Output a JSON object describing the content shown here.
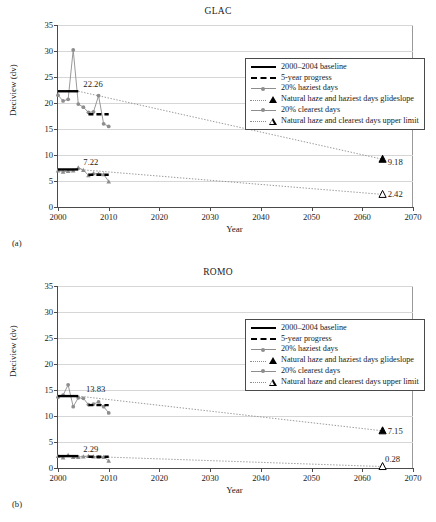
{
  "figure": {
    "axis_label_y": "Deciview (dv)",
    "axis_label_x": "Year",
    "legend": [
      {
        "key": "solid-line",
        "label": "2000–2004 baseline"
      },
      {
        "key": "dashed-line",
        "label": "5-year progress"
      },
      {
        "key": "marker-line",
        "label": "20% haziest days"
      },
      {
        "key": "filled-triangle",
        "label": "Natural haze and haziest days glideslope"
      },
      {
        "key": "marker-line",
        "label": "20% clearest days"
      },
      {
        "key": "open-triangle",
        "label": "Natural haze and clearest days upper limit"
      }
    ]
  },
  "panels": [
    {
      "tag": "(a)",
      "title": "GLAC",
      "chart_data": {
        "type": "line",
        "title": "GLAC",
        "xlabel": "Year",
        "ylabel": "Deciview (dv)",
        "xlim": [
          2000,
          2070
        ],
        "ylim": [
          0,
          35
        ],
        "xticks": [
          2000,
          2010,
          2020,
          2030,
          2040,
          2050,
          2060,
          2070
        ],
        "yticks": [
          0,
          5,
          10,
          15,
          20,
          25,
          30,
          35
        ],
        "grid": "horizontal",
        "legend_position": "upper-center",
        "series": [
          {
            "name": "20% haziest days",
            "style": "gray-line-circle-markers",
            "x": [
              2000,
              2001,
              2002,
              2003,
              2004,
              2005,
              2006,
              2007,
              2008,
              2009,
              2010
            ],
            "y": [
              21.5,
              20.4,
              20.7,
              30.2,
              19.8,
              19.2,
              18.2,
              18.3,
              21.4,
              16.0,
              15.5
            ]
          },
          {
            "name": "20% clearest days",
            "style": "gray-line-triangle-markers",
            "x": [
              2000,
              2001,
              2002,
              2003,
              2004,
              2005,
              2006,
              2007,
              2008,
              2009,
              2010
            ],
            "y": [
              7.0,
              6.8,
              6.9,
              7.0,
              7.6,
              7.1,
              6.1,
              6.5,
              6.4,
              6.3,
              4.9
            ]
          },
          {
            "name": "Natural haze and haziest days glideslope",
            "style": "dotted-line",
            "x": [
              2004,
              2064
            ],
            "y": [
              22.26,
              9.18
            ]
          },
          {
            "name": "Natural haze and clearest days upper limit",
            "style": "dotted-line",
            "x": [
              2004,
              2064
            ],
            "y": [
              7.22,
              2.42
            ]
          }
        ],
        "segments": [
          {
            "name": "2000–2004 baseline (haziest)",
            "style": "solid-black",
            "x": [
              2000,
              2004
            ],
            "y": 22.26
          },
          {
            "name": "5-year progress (haziest)",
            "style": "dashed-black",
            "x": [
              2006,
              2010
            ],
            "y": 17.85
          },
          {
            "name": "2000–2004 baseline (clearest)",
            "style": "solid-black",
            "x": [
              2000,
              2004
            ],
            "y": 7.22
          },
          {
            "name": "5-year progress (clearest)",
            "style": "dashed-black",
            "x": [
              2006,
              2010
            ],
            "y": 6.2
          }
        ],
        "annotations": [
          {
            "text": "22.26",
            "x": 2005,
            "y": 23.6
          },
          {
            "text": "7.22",
            "x": 2005,
            "y": 8.6
          },
          {
            "text": "9.18",
            "x": 2065,
            "y": 8.7
          },
          {
            "text": "2.42",
            "x": 2065,
            "y": 2.42
          }
        ]
      }
    },
    {
      "tag": "(b)",
      "title": "ROMO",
      "chart_data": {
        "type": "line",
        "title": "ROMO",
        "xlabel": "Year",
        "ylabel": "Deciview (dv)",
        "xlim": [
          2000,
          2070
        ],
        "ylim": [
          0,
          35
        ],
        "xticks": [
          2000,
          2010,
          2020,
          2030,
          2040,
          2050,
          2060,
          2070
        ],
        "yticks": [
          0,
          5,
          10,
          15,
          20,
          25,
          30,
          35
        ],
        "grid": "horizontal",
        "legend_position": "upper-center",
        "series": [
          {
            "name": "20% haziest days",
            "style": "gray-line-circle-markers",
            "x": [
              2000,
              2001,
              2002,
              2003,
              2004,
              2005,
              2006,
              2007,
              2008,
              2009,
              2010
            ],
            "y": [
              13.6,
              14.0,
              16.0,
              11.8,
              13.5,
              13.4,
              12.2,
              12.3,
              12.7,
              11.8,
              10.6
            ]
          },
          {
            "name": "20% clearest days",
            "style": "gray-line-triangle-markers",
            "x": [
              2000,
              2001,
              2002,
              2003,
              2004,
              2005,
              2006,
              2007,
              2008,
              2009,
              2010
            ],
            "y": [
              2.3,
              2.0,
              2.5,
              2.1,
              2.1,
              2.2,
              2.3,
              2.2,
              2.1,
              2.1,
              1.4
            ]
          },
          {
            "name": "Natural haze and haziest days glideslope",
            "style": "dotted-line",
            "x": [
              2004,
              2064
            ],
            "y": [
              13.83,
              7.15
            ]
          },
          {
            "name": "Natural haze and clearest days upper limit",
            "style": "dotted-line",
            "x": [
              2004,
              2064
            ],
            "y": [
              2.29,
              0.28
            ]
          }
        ],
        "segments": [
          {
            "name": "2000–2004 baseline (haziest)",
            "style": "solid-black",
            "x": [
              2000,
              2004
            ],
            "y": 13.83
          },
          {
            "name": "5-year progress (haziest)",
            "style": "dashed-black",
            "x": [
              2006,
              2010
            ],
            "y": 12.1
          },
          {
            "name": "2000–2004 baseline (clearest)",
            "style": "solid-black",
            "x": [
              2000,
              2004
            ],
            "y": 2.29
          },
          {
            "name": "5-year progress (clearest)",
            "style": "dashed-black",
            "x": [
              2006,
              2010
            ],
            "y": 2.15
          }
        ],
        "annotations": [
          {
            "text": "13.83",
            "x": 2005.5,
            "y": 15.1
          },
          {
            "text": "2.29",
            "x": 2005,
            "y": 3.6
          },
          {
            "text": "7.15",
            "x": 2065,
            "y": 7.15
          },
          {
            "text": "0.28",
            "x": 2064.5,
            "y": 1.7
          }
        ]
      }
    }
  ]
}
